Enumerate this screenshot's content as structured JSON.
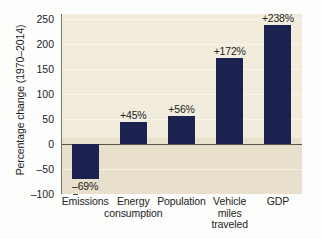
{
  "chart_data": {
    "type": "bar",
    "title": "",
    "xlabel": "",
    "ylabel": "Percentage change (1970–2014)",
    "categories": [
      "Emissions",
      "Energy consumption",
      "Population",
      "Vehicle miles traveled",
      "GDP"
    ],
    "values": [
      -69,
      45,
      56,
      172,
      238
    ],
    "data_labels": [
      "–69%",
      "+45%",
      "+56%",
      "+172%",
      "+238%"
    ],
    "ylim": [
      -100,
      260
    ],
    "yticks": [
      250,
      200,
      150,
      100,
      50,
      0,
      -50,
      -100
    ],
    "ytick_labels": [
      "250",
      "200",
      "150",
      "100",
      "50",
      "0",
      "–50",
      "–100"
    ],
    "grid": true,
    "legend": null,
    "bar_color": "#1c2250",
    "plot_background": "#f2ecdd"
  },
  "axis": {
    "y_title": "Percentage change (1970–2014)"
  },
  "x_labels": [
    {
      "lines": [
        "Emissions"
      ]
    },
    {
      "lines": [
        "Energy",
        "consumption"
      ]
    },
    {
      "lines": [
        "Population"
      ]
    },
    {
      "lines": [
        "Vehicle",
        "miles",
        "traveled"
      ]
    },
    {
      "lines": [
        "GDP"
      ]
    }
  ],
  "scan": {
    "bottom_fragment": ""
  }
}
